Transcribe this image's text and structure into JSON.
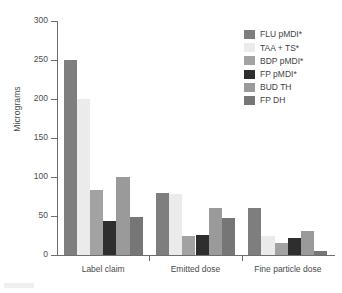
{
  "chart_data": {
    "type": "bar",
    "title": "",
    "xlabel": "",
    "ylabel": "Micrograms",
    "ylim": [
      0,
      300
    ],
    "yticks": [
      0,
      50,
      100,
      150,
      200,
      250,
      300
    ],
    "grid": false,
    "legend_position": "top-right",
    "categories": [
      "Label claim",
      "Emitted dose",
      "Fine particle dose"
    ],
    "series": [
      {
        "name": "FLU pMDI*",
        "color": "#7e7e7e",
        "values": [
          250,
          79,
          60
        ]
      },
      {
        "name": "TAA + TS*",
        "color": "#ebebeb",
        "values": [
          200,
          78,
          25
        ]
      },
      {
        "name": "BDP pMDI*",
        "color": "#a2a2a2",
        "values": [
          83,
          25,
          15
        ]
      },
      {
        "name": "FP pMDI*",
        "color": "#2e2e2e",
        "values": [
          43,
          26,
          22
        ]
      },
      {
        "name": "BUD TH",
        "color": "#9a9a9a",
        "values": [
          100,
          60,
          31
        ]
      },
      {
        "name": "FP DH",
        "color": "#767676",
        "values": [
          49,
          48,
          5
        ]
      }
    ]
  },
  "axis": {
    "y_title": "Micrograms"
  }
}
